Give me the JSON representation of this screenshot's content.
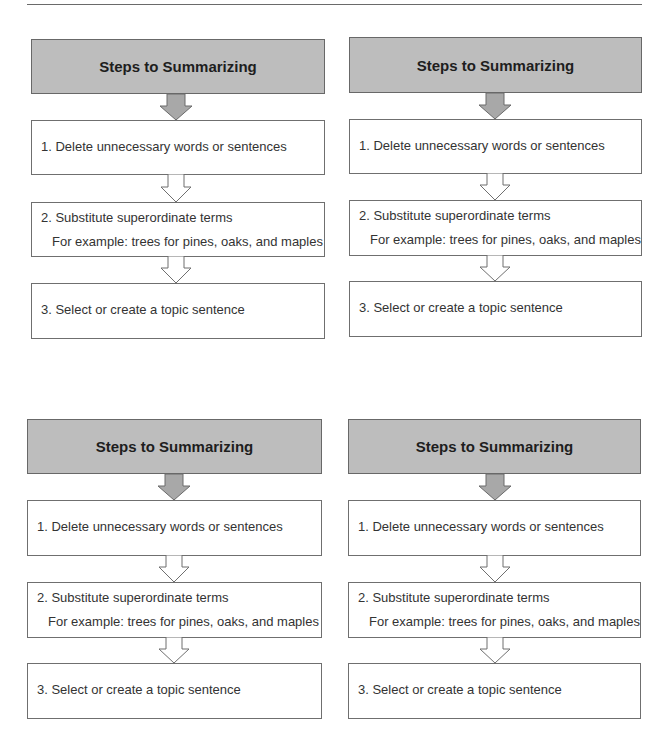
{
  "page": {
    "rule_color": "#6a6a6a"
  },
  "colors": {
    "header_fill": "#bdbdbd",
    "header_border": "#686868",
    "box_border": "#6f6f6f",
    "arrow_fill": "#a8a8a8"
  },
  "diagrams": [
    {
      "title": "Steps to Summarizing",
      "steps": [
        {
          "label": "1. Delete unnecessary words or sentences"
        },
        {
          "label": "2. Substitute superordinate terms",
          "example": "For example: trees for pines, oaks, and maples"
        },
        {
          "label": "3. Select or create a topic sentence"
        }
      ]
    },
    {
      "title": "Steps to Summarizing",
      "steps": [
        {
          "label": "1. Delete unnecessary words or sentences"
        },
        {
          "label": "2. Substitute superordinate terms",
          "example": "For example: trees for pines, oaks, and maples"
        },
        {
          "label": "3. Select or create a topic sentence"
        }
      ]
    },
    {
      "title": "Steps to Summarizing",
      "steps": [
        {
          "label": "1. Delete unnecessary words or sentences"
        },
        {
          "label": "2. Substitute superordinate terms",
          "example": "For example: trees for pines, oaks, and maples"
        },
        {
          "label": "3. Select or create a topic sentence"
        }
      ]
    },
    {
      "title": "Steps to Summarizing",
      "steps": [
        {
          "label": "1. Delete unnecessary words or sentences"
        },
        {
          "label": "2. Substitute superordinate terms",
          "example": "For example: trees for pines, oaks, and maples"
        },
        {
          "label": "3. Select or create a topic sentence"
        }
      ]
    }
  ]
}
